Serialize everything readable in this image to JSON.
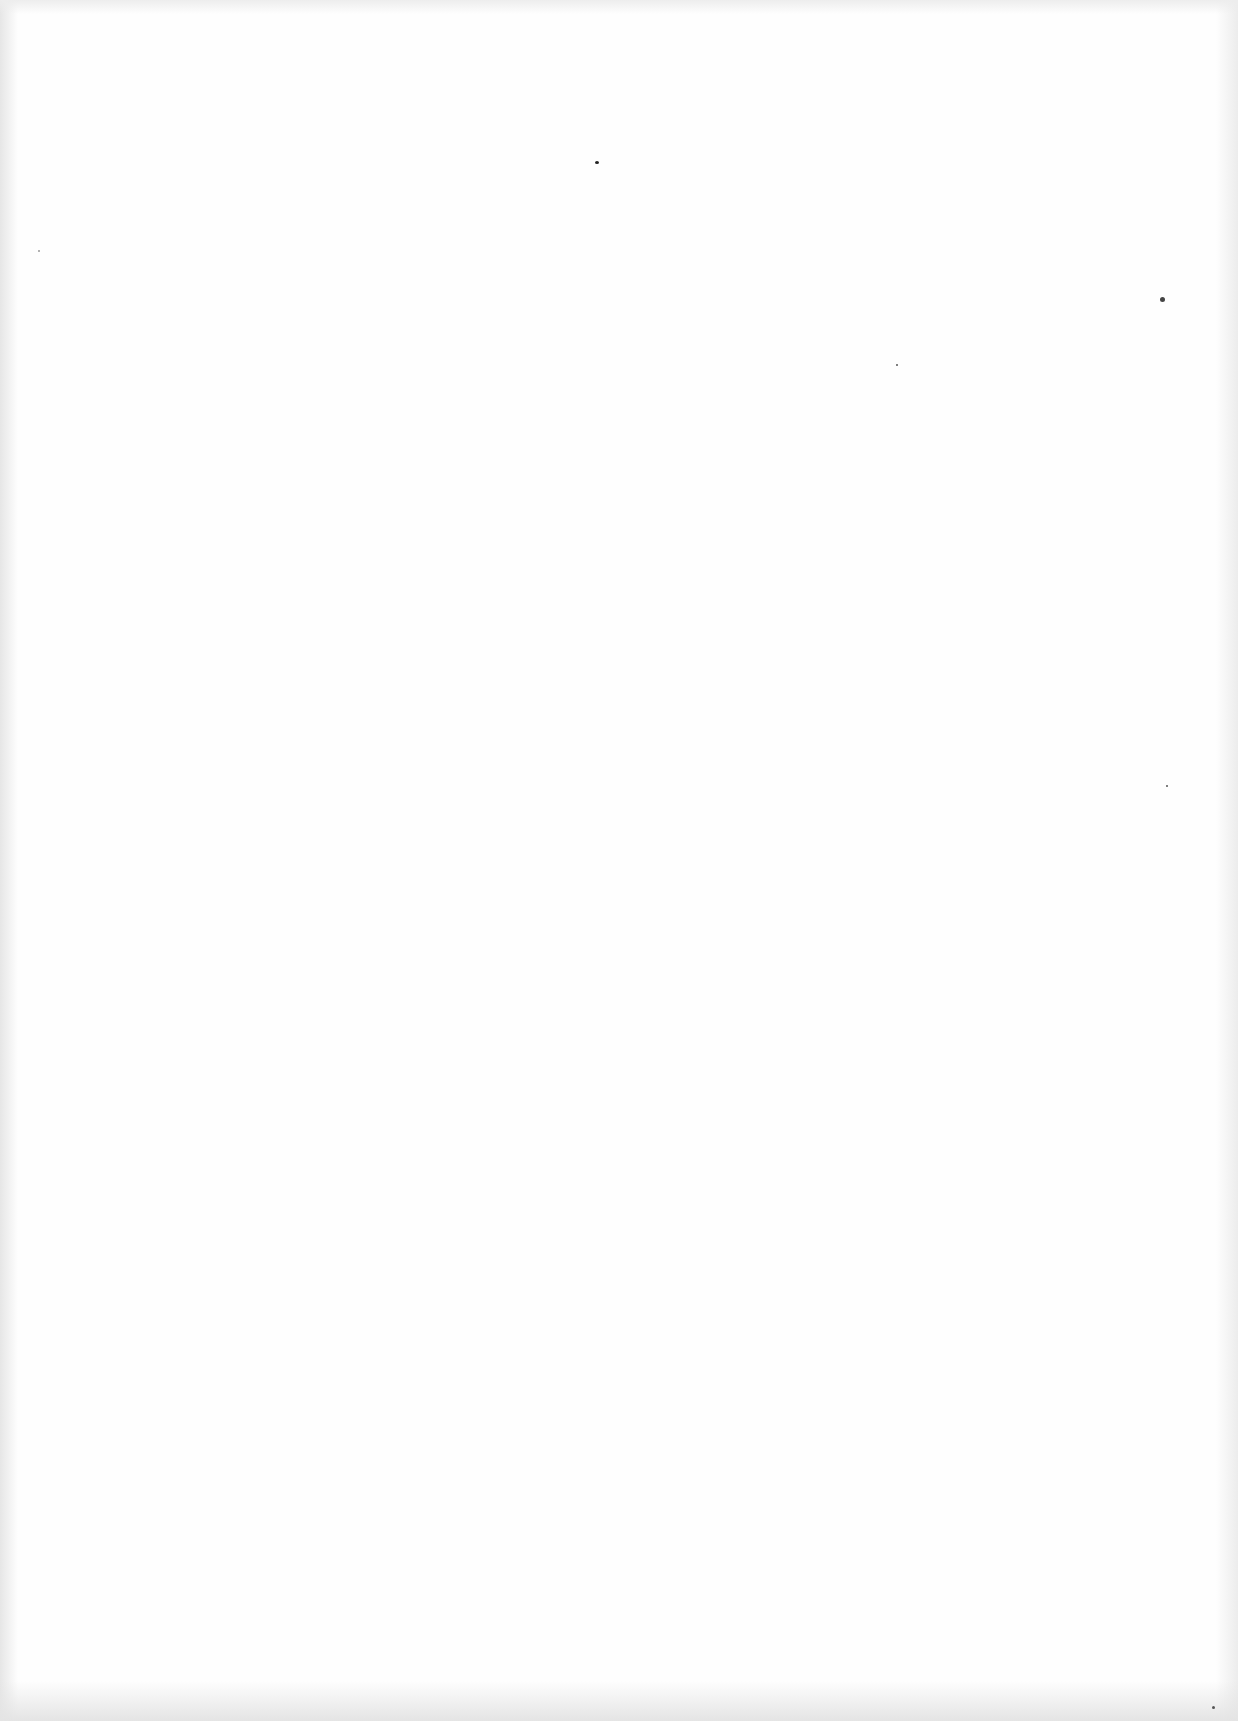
{
  "page": {
    "type": "blank-scanned-page",
    "background": "#fefefe",
    "text_content": ""
  }
}
